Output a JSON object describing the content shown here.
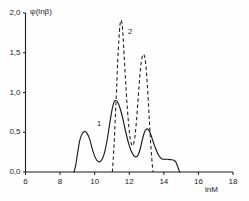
{
  "chart_data": {
    "type": "line",
    "title": "",
    "xlabel": "lnM",
    "ylabel": "ψ(lnβ)",
    "xlim": [
      6,
      18
    ],
    "ylim": [
      0.0,
      2.0
    ],
    "grid": false,
    "legend_position": "inline-annotations",
    "xticks": [
      6,
      8,
      10,
      12,
      14,
      16,
      18
    ],
    "xtick_labels": [
      "6",
      "8",
      "10",
      "12",
      "14",
      "16",
      "18"
    ],
    "yticks": [
      0.0,
      0.5,
      1.0,
      1.5,
      2.0
    ],
    "ytick_labels": [
      "0,0",
      "0,5",
      "1,0",
      "1,5",
      "2,0"
    ],
    "annotations": [
      {
        "text": "1",
        "x": 10.25,
        "y": 0.6,
        "refers_to": "curve-1-solid"
      },
      {
        "text": "2",
        "x": 12.05,
        "y": 1.76,
        "refers_to": "curve-2-dashed"
      }
    ],
    "series": [
      {
        "name": "1",
        "style": "solid",
        "color": "#1c1c1c",
        "points": [
          [
            8.8,
            0.0
          ],
          [
            8.9,
            0.08
          ],
          [
            9.0,
            0.22
          ],
          [
            9.12,
            0.38
          ],
          [
            9.25,
            0.47
          ],
          [
            9.4,
            0.51
          ],
          [
            9.55,
            0.49
          ],
          [
            9.7,
            0.42
          ],
          [
            9.85,
            0.3
          ],
          [
            10.0,
            0.2
          ],
          [
            10.15,
            0.14
          ],
          [
            10.3,
            0.13
          ],
          [
            10.45,
            0.17
          ],
          [
            10.6,
            0.27
          ],
          [
            10.75,
            0.44
          ],
          [
            10.9,
            0.65
          ],
          [
            11.02,
            0.8
          ],
          [
            11.12,
            0.88
          ],
          [
            11.22,
            0.9
          ],
          [
            11.35,
            0.87
          ],
          [
            11.5,
            0.78
          ],
          [
            11.65,
            0.65
          ],
          [
            11.8,
            0.5
          ],
          [
            11.95,
            0.37
          ],
          [
            12.1,
            0.27
          ],
          [
            12.25,
            0.21
          ],
          [
            12.38,
            0.19
          ],
          [
            12.5,
            0.21
          ],
          [
            12.62,
            0.28
          ],
          [
            12.75,
            0.4
          ],
          [
            12.88,
            0.5
          ],
          [
            13.0,
            0.54
          ],
          [
            13.12,
            0.53
          ],
          [
            13.25,
            0.47
          ],
          [
            13.4,
            0.37
          ],
          [
            13.55,
            0.28
          ],
          [
            13.7,
            0.21
          ],
          [
            13.85,
            0.17
          ],
          [
            14.0,
            0.16
          ],
          [
            14.2,
            0.16
          ],
          [
            14.4,
            0.155
          ],
          [
            14.55,
            0.15
          ],
          [
            14.68,
            0.13
          ],
          [
            14.78,
            0.08
          ],
          [
            14.88,
            0.02
          ],
          [
            14.93,
            0.0
          ]
        ]
      },
      {
        "name": "2",
        "style": "dashed",
        "color": "#1c1c1c",
        "points": [
          [
            11.02,
            0.0
          ],
          [
            11.08,
            0.18
          ],
          [
            11.14,
            0.42
          ],
          [
            11.2,
            0.72
          ],
          [
            11.27,
            1.05
          ],
          [
            11.33,
            1.38
          ],
          [
            11.4,
            1.66
          ],
          [
            11.46,
            1.84
          ],
          [
            11.52,
            1.91
          ],
          [
            11.58,
            1.87
          ],
          [
            11.64,
            1.72
          ],
          [
            11.7,
            1.48
          ],
          [
            11.78,
            1.18
          ],
          [
            11.86,
            0.9
          ],
          [
            11.94,
            0.66
          ],
          [
            12.02,
            0.48
          ],
          [
            12.1,
            0.37
          ],
          [
            12.18,
            0.33
          ],
          [
            12.26,
            0.36
          ],
          [
            12.34,
            0.47
          ],
          [
            12.42,
            0.65
          ],
          [
            12.5,
            0.88
          ],
          [
            12.58,
            1.12
          ],
          [
            12.66,
            1.32
          ],
          [
            12.74,
            1.44
          ],
          [
            12.82,
            1.48
          ],
          [
            12.9,
            1.44
          ],
          [
            12.98,
            1.3
          ],
          [
            13.05,
            1.08
          ],
          [
            13.12,
            0.82
          ],
          [
            13.18,
            0.58
          ],
          [
            13.24,
            0.36
          ],
          [
            13.3,
            0.18
          ],
          [
            13.35,
            0.05
          ],
          [
            13.38,
            0.0
          ]
        ]
      }
    ]
  },
  "axes": {
    "y_title": "ψ(lnβ)",
    "x_title": "lnM"
  }
}
